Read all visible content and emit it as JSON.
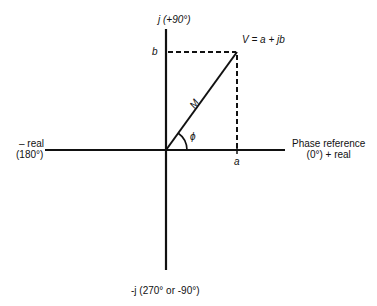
{
  "diagram": {
    "type": "phasor",
    "labels": {
      "pos_imag": "j (+90°)",
      "neg_imag": "-j (270° or -90°)",
      "neg_real_line1": "– real",
      "neg_real_line2": "(180°)",
      "pos_real_line1": "Phase reference",
      "pos_real_line2": "(0°) + real",
      "vector": "V = a + jb",
      "magnitude": "M",
      "angle": "ϕ",
      "real_component": "a",
      "imag_component": "b"
    },
    "colors": {
      "line": "#111111",
      "background": "#ffffff"
    }
  }
}
